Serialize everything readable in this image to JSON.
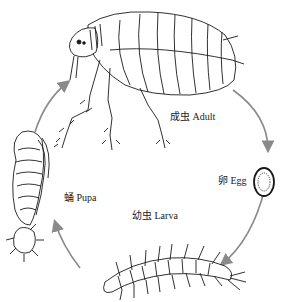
{
  "diagram": {
    "title": "",
    "type": "life-cycle",
    "stages": [
      {
        "id": "adult",
        "label": "成虫 Adult"
      },
      {
        "id": "egg",
        "label": "卵 Egg"
      },
      {
        "id": "larva",
        "label": "幼虫 Larva"
      },
      {
        "id": "pupa",
        "label": "蛹 Pupa"
      }
    ],
    "arrows": [
      {
        "from": "adult",
        "to": "egg"
      },
      {
        "from": "egg",
        "to": "larva"
      },
      {
        "from": "larva",
        "to": "pupa"
      },
      {
        "from": "pupa",
        "to": "adult"
      }
    ],
    "colors": {
      "arrow": "#8a8a8a",
      "ink": "#1a1a1a",
      "background": "#ffffff"
    }
  }
}
